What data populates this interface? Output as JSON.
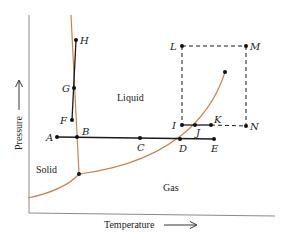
{
  "diagram": {
    "type": "phase-diagram",
    "axes": {
      "x_label": "Temperature",
      "y_label": "Pressure"
    },
    "regions": {
      "solid": "Solid",
      "liquid": "Liquid",
      "gas": "Gas"
    },
    "points": {
      "A": "A",
      "B": "B",
      "C": "C",
      "D": "D",
      "E": "E",
      "F": "F",
      "G": "G",
      "H": "H",
      "I": "I",
      "J": "J",
      "K": "K",
      "L": "L",
      "M": "M",
      "N": "N"
    },
    "colors": {
      "curve": "#c8844a",
      "line": "#1a1a1a",
      "axis": "#777777"
    }
  }
}
